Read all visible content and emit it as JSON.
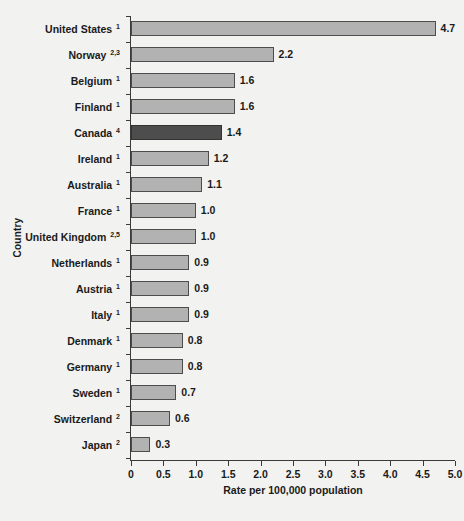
{
  "chart_data": {
    "type": "bar",
    "orientation": "horizontal",
    "title": "",
    "xlabel": "Rate per 100,000 population",
    "ylabel": "Country",
    "xlim": [
      0,
      5.0
    ],
    "xticks": [
      "0",
      "0.5",
      "1.0",
      "1.5",
      "2.0",
      "2.5",
      "3.0",
      "3.5",
      "4.0",
      "4.5",
      "5.0"
    ],
    "xtick_values": [
      0,
      0.5,
      1.0,
      1.5,
      2.0,
      2.5,
      3.0,
      3.5,
      4.0,
      4.5,
      5.0
    ],
    "grid": false,
    "legend": "none",
    "categories": [
      "United States",
      "Norway",
      "Belgium",
      "Finland",
      "Canada",
      "Ireland",
      "Australia",
      "France",
      "United Kingdom",
      "Netherlands",
      "Austria",
      "Italy",
      "Denmark",
      "Germany",
      "Sweden",
      "Switzerland",
      "Japan"
    ],
    "category_footnotes": [
      "1",
      "2,3",
      "1",
      "1",
      "4",
      "1",
      "1",
      "1",
      "2,5",
      "1",
      "1",
      "1",
      "1",
      "1",
      "1",
      "2",
      "2"
    ],
    "values": [
      4.7,
      2.2,
      1.6,
      1.6,
      1.4,
      1.2,
      1.1,
      1.0,
      1.0,
      0.9,
      0.9,
      0.9,
      0.8,
      0.8,
      0.7,
      0.6,
      0.3
    ],
    "value_labels": [
      "4.7",
      "2.2",
      "1.6",
      "1.6",
      "1.4",
      "1.2",
      "1.1",
      "1.0",
      "1.0",
      "0.9",
      "0.9",
      "0.9",
      "0.8",
      "0.8",
      "0.7",
      "0.6",
      "0.3"
    ],
    "highlight_category": "Canada",
    "colors": {
      "bar_fill": "#b2b2b2",
      "bar_border": "#4d4d4d",
      "highlight_fill": "#4d4d4d",
      "highlight_border": "#333333",
      "axis": "#3a3a3a",
      "text": "#1a1a1a",
      "background": "#f2f2f0"
    }
  }
}
